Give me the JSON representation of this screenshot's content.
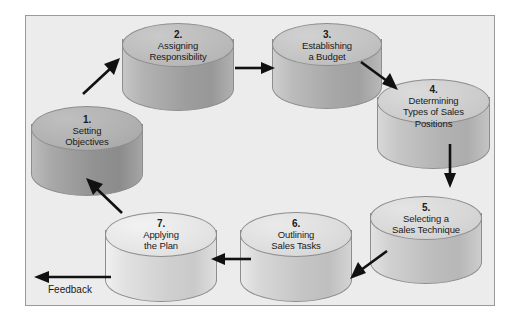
{
  "diagram": {
    "frame": {
      "background_color": "#ececed",
      "border_color": "#9a9a9a"
    },
    "feedback": {
      "label": "Feedback",
      "arrow_direction": "left"
    },
    "steps": [
      {
        "number": "1.",
        "lines": [
          "Setting",
          "Objectives"
        ],
        "top_color": "#b2b2b2",
        "body_color_light": "#a8a8a8",
        "body_color_dark": "#8f8f8f"
      },
      {
        "number": "2.",
        "lines": [
          "Assigning",
          "Responsibility"
        ],
        "top_color": "#bcbcbc",
        "body_color_light": "#b3b3b3",
        "body_color_dark": "#999999"
      },
      {
        "number": "3.",
        "lines": [
          "Establishing",
          "a Budget"
        ],
        "top_color": "#c4c4c4",
        "body_color_light": "#bbbbbb",
        "body_color_dark": "#a2a2a2"
      },
      {
        "number": "4.",
        "lines": [
          "Determining",
          "Types of Sales",
          "Positions"
        ],
        "top_color": "#cecece",
        "body_color_light": "#c6c6c6",
        "body_color_dark": "#aeaeae"
      },
      {
        "number": "5.",
        "lines": [
          "Selecting a",
          "Sales Technique"
        ],
        "top_color": "#d8d8d8",
        "body_color_light": "#d0d0d0",
        "body_color_dark": "#b7b7b7"
      },
      {
        "number": "6.",
        "lines": [
          "Outlining",
          "Sales Tasks"
        ],
        "top_color": "#dedede",
        "body_color_light": "#d7d7d7",
        "body_color_dark": "#bfbfbf"
      },
      {
        "number": "7.",
        "lines": [
          "Applying",
          "the Plan"
        ],
        "top_color": "#e6e6e6",
        "body_color_light": "#e1e1e1",
        "body_color_dark": "#cacaca"
      }
    ],
    "connectors": [
      {
        "from": "1",
        "to": "2",
        "direction": "up-right"
      },
      {
        "from": "2",
        "to": "3",
        "direction": "right"
      },
      {
        "from": "3",
        "to": "4",
        "direction": "down-right"
      },
      {
        "from": "4",
        "to": "5",
        "direction": "down"
      },
      {
        "from": "5",
        "to": "6",
        "direction": "down-left"
      },
      {
        "from": "6",
        "to": "7",
        "direction": "left"
      },
      {
        "from": "7",
        "to": "1",
        "direction": "up-left"
      }
    ]
  }
}
